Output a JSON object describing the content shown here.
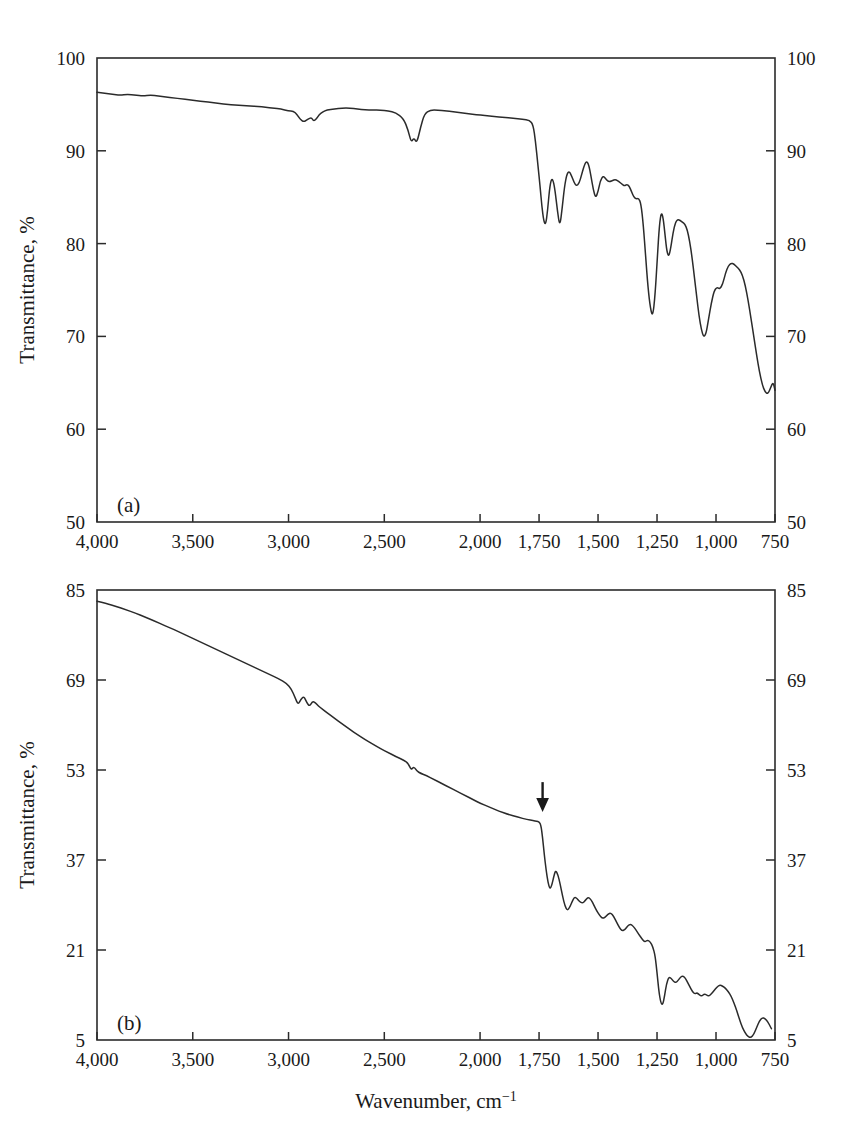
{
  "figure": {
    "kind": "ftir-transmittance-spectra",
    "stroke_color": "#2b2b2b",
    "background_color": "#ffffff",
    "xlabel": "Wavenumber, cm",
    "xlabel_superscript": "−1",
    "ylabel": "Transmittance, %",
    "panel_a_tag": "(a)",
    "panel_b_tag": "(b)"
  },
  "chart_data": [
    {
      "type": "line",
      "id": "panel-a",
      "title": "(a)",
      "xlabel": "Wavenumber, cm−1",
      "ylabel": "Transmittance, %",
      "xlim": [
        4000,
        750
      ],
      "ylim": [
        50,
        100
      ],
      "x_inverted": true,
      "x_piecewise_break": 2000,
      "grid": false,
      "legend": null,
      "xticks": [
        4000,
        3500,
        3000,
        2500,
        2000,
        1750,
        1500,
        1250,
        1000,
        750
      ],
      "xtick_labels": [
        "4,000",
        "3,500",
        "3,000",
        "2,500",
        "2,000",
        "1,750",
        "1,500",
        "1,250",
        "1,000",
        "750"
      ],
      "yticks": [
        50,
        60,
        70,
        80,
        90,
        100
      ],
      "ytick_labels": [
        "50",
        "60",
        "70",
        "80",
        "90",
        "100"
      ],
      "ytick_labels_right": [
        "50",
        "60",
        "70",
        "80",
        "90",
        "100"
      ],
      "x": [
        4000,
        3960,
        3920,
        3880,
        3840,
        3800,
        3760,
        3720,
        3680,
        3640,
        3600,
        3560,
        3520,
        3480,
        3440,
        3400,
        3360,
        3320,
        3280,
        3240,
        3200,
        3160,
        3120,
        3080,
        3040,
        3000,
        2975,
        2955,
        2940,
        2920,
        2900,
        2880,
        2870,
        2855,
        2840,
        2820,
        2800,
        2760,
        2720,
        2680,
        2640,
        2600,
        2560,
        2520,
        2480,
        2440,
        2400,
        2375,
        2360,
        2345,
        2330,
        2310,
        2290,
        2260,
        2220,
        2180,
        2140,
        2100,
        2060,
        2020,
        1980,
        1940,
        1900,
        1860,
        1820,
        1790,
        1775,
        1765,
        1755,
        1745,
        1738,
        1730,
        1722,
        1714,
        1706,
        1698,
        1690,
        1682,
        1672,
        1662,
        1652,
        1642,
        1632,
        1622,
        1612,
        1602,
        1592,
        1580,
        1570,
        1560,
        1550,
        1540,
        1530,
        1520,
        1510,
        1500,
        1490,
        1478,
        1468,
        1458,
        1448,
        1438,
        1428,
        1418,
        1408,
        1398,
        1388,
        1378,
        1368,
        1358,
        1348,
        1338,
        1328,
        1318,
        1308,
        1298,
        1288,
        1278,
        1268,
        1258,
        1248,
        1240,
        1232,
        1224,
        1216,
        1208,
        1200,
        1192,
        1182,
        1172,
        1162,
        1152,
        1142,
        1132,
        1122,
        1112,
        1102,
        1092,
        1082,
        1072,
        1062,
        1052,
        1042,
        1032,
        1020,
        1008,
        996,
        984,
        972,
        960,
        948,
        936,
        924,
        912,
        900,
        888,
        876,
        864,
        852,
        840,
        828,
        816,
        804,
        792,
        780,
        768,
        758,
        750
      ],
      "y": [
        96.3,
        96.2,
        96.1,
        96.0,
        96.1,
        96.0,
        95.9,
        96.0,
        95.9,
        95.8,
        95.7,
        95.6,
        95.5,
        95.4,
        95.3,
        95.2,
        95.1,
        95.0,
        94.9,
        94.9,
        94.8,
        94.8,
        94.7,
        94.6,
        94.5,
        94.3,
        94.3,
        93.9,
        93.4,
        93.1,
        93.4,
        93.6,
        93.2,
        93.4,
        93.9,
        94.2,
        94.4,
        94.5,
        94.6,
        94.6,
        94.5,
        94.4,
        94.4,
        94.4,
        94.3,
        94.1,
        93.5,
        92.2,
        90.9,
        91.4,
        90.8,
        92.6,
        94.0,
        94.4,
        94.4,
        94.3,
        94.2,
        94.1,
        94.0,
        93.9,
        93.8,
        93.7,
        93.6,
        93.5,
        93.4,
        93.3,
        92.8,
        91.0,
        88.5,
        86.0,
        84.0,
        82.4,
        82.0,
        83.5,
        85.8,
        87.0,
        86.8,
        85.7,
        83.5,
        81.8,
        83.8,
        86.2,
        87.5,
        87.8,
        87.3,
        86.6,
        86.2,
        86.5,
        87.4,
        88.3,
        88.9,
        88.6,
        87.3,
        85.8,
        84.9,
        85.6,
        86.8,
        87.3,
        87.0,
        86.7,
        86.7,
        86.8,
        86.9,
        86.8,
        86.6,
        86.4,
        86.2,
        86.4,
        86.2,
        85.6,
        85.0,
        84.8,
        84.9,
        84.3,
        82.0,
        78.5,
        75.2,
        73.0,
        72.1,
        74.5,
        78.8,
        82.0,
        83.4,
        82.8,
        80.9,
        79.1,
        78.6,
        79.5,
        81.2,
        82.3,
        82.6,
        82.5,
        82.3,
        82.1,
        81.5,
        80.3,
        78.6,
        76.5,
        74.3,
        72.2,
        70.7,
        69.9,
        70.3,
        71.8,
        73.6,
        74.9,
        75.3,
        75.1,
        75.6,
        76.8,
        77.6,
        77.9,
        77.8,
        77.5,
        77.2,
        76.6,
        75.5,
        73.9,
        72.0,
        70.0,
        68.0,
        66.2,
        64.8,
        64.0,
        63.8,
        64.5,
        65.1,
        64.2,
        62.0,
        58.8,
        55.2,
        52.5,
        50.6
      ]
    },
    {
      "type": "line",
      "id": "panel-b",
      "title": "(b)",
      "xlabel": "Wavenumber, cm−1",
      "ylabel": "Transmittance, %",
      "xlim": [
        4000,
        750
      ],
      "ylim": [
        5,
        85
      ],
      "x_inverted": true,
      "x_piecewise_break": 2000,
      "grid": false,
      "legend": null,
      "annotations": [
        {
          "type": "arrow",
          "x": 1735,
          "y": 48,
          "label": "",
          "direction": "down"
        }
      ],
      "xticks": [
        4000,
        3500,
        3000,
        2500,
        2000,
        1750,
        1500,
        1250,
        1000,
        750
      ],
      "xtick_labels": [
        "4,000",
        "3,500",
        "3,000",
        "2,500",
        "2,000",
        "1,750",
        "1,500",
        "1,250",
        "1,000",
        "750"
      ],
      "yticks": [
        5,
        21,
        37,
        53,
        69,
        85
      ],
      "ytick_labels": [
        "5",
        "21",
        "37",
        "53",
        "69",
        "85"
      ],
      "ytick_labels_right": [
        "5",
        "21",
        "37",
        "53",
        "69",
        "85"
      ],
      "x": [
        4000,
        3950,
        3900,
        3850,
        3800,
        3750,
        3700,
        3650,
        3600,
        3550,
        3500,
        3450,
        3400,
        3350,
        3300,
        3250,
        3200,
        3150,
        3100,
        3050,
        3010,
        2985,
        2965,
        2950,
        2935,
        2920,
        2905,
        2890,
        2875,
        2860,
        2845,
        2830,
        2800,
        2760,
        2720,
        2680,
        2640,
        2600,
        2560,
        2520,
        2480,
        2440,
        2400,
        2375,
        2360,
        2345,
        2330,
        2310,
        2280,
        2240,
        2200,
        2160,
        2120,
        2080,
        2040,
        2000,
        1960,
        1920,
        1880,
        1840,
        1800,
        1775,
        1760,
        1750,
        1742,
        1735,
        1728,
        1720,
        1712,
        1704,
        1696,
        1688,
        1680,
        1670,
        1660,
        1650,
        1640,
        1630,
        1620,
        1610,
        1600,
        1590,
        1578,
        1566,
        1554,
        1542,
        1530,
        1518,
        1506,
        1494,
        1482,
        1470,
        1458,
        1446,
        1434,
        1422,
        1410,
        1398,
        1386,
        1374,
        1362,
        1350,
        1338,
        1326,
        1314,
        1302,
        1290,
        1278,
        1268,
        1258,
        1250,
        1242,
        1234,
        1226,
        1218,
        1210,
        1200,
        1190,
        1180,
        1170,
        1160,
        1150,
        1140,
        1130,
        1120,
        1110,
        1100,
        1090,
        1080,
        1070,
        1060,
        1050,
        1040,
        1030,
        1020,
        1008,
        996,
        984,
        972,
        960,
        948,
        936,
        924,
        912,
        900,
        888,
        876,
        864,
        852,
        840,
        828,
        816,
        804,
        792,
        780,
        770,
        760,
        750
      ],
      "y": [
        83.0,
        82.6,
        82.1,
        81.5,
        80.9,
        80.2,
        79.5,
        78.7,
        78.0,
        77.2,
        76.4,
        75.6,
        74.8,
        74.0,
        73.2,
        72.4,
        71.6,
        70.8,
        70.0,
        69.2,
        68.4,
        67.4,
        65.8,
        64.6,
        65.6,
        66.1,
        65.0,
        64.3,
        65.2,
        65.0,
        64.4,
        64.0,
        63.2,
        62.2,
        61.2,
        60.2,
        59.3,
        58.4,
        57.6,
        56.8,
        56.1,
        55.4,
        54.8,
        54.2,
        53.0,
        53.6,
        52.8,
        52.4,
        52.0,
        51.3,
        50.6,
        49.9,
        49.2,
        48.5,
        47.8,
        47.1,
        46.4,
        45.7,
        45.1,
        44.6,
        44.2,
        44.0,
        43.9,
        43.8,
        43.2,
        41.0,
        38.0,
        35.2,
        33.0,
        31.8,
        32.5,
        34.0,
        35.2,
        34.4,
        32.6,
        30.5,
        28.8,
        28.0,
        28.6,
        29.6,
        30.4,
        30.2,
        29.6,
        29.3,
        29.8,
        30.4,
        30.0,
        29.0,
        28.0,
        27.2,
        26.6,
        26.8,
        27.4,
        27.6,
        27.0,
        26.0,
        25.0,
        24.4,
        24.6,
        25.3,
        25.6,
        25.2,
        24.5,
        23.7,
        23.0,
        22.4,
        22.8,
        22.4,
        21.6,
        20.0,
        17.0,
        13.6,
        11.6,
        11.2,
        12.8,
        15.0,
        16.2,
        16.0,
        15.4,
        15.2,
        15.6,
        16.2,
        16.4,
        16.0,
        15.2,
        14.4,
        13.6,
        13.2,
        13.4,
        13.0,
        12.8,
        13.2,
        13.0,
        12.8,
        13.2,
        13.8,
        14.4,
        14.8,
        14.6,
        14.2,
        13.6,
        12.8,
        11.6,
        10.2,
        8.6,
        7.2,
        6.2,
        5.6,
        5.4,
        6.0,
        7.2,
        8.4,
        9.0,
        8.8,
        8.2,
        7.4,
        6.6
      ]
    }
  ]
}
